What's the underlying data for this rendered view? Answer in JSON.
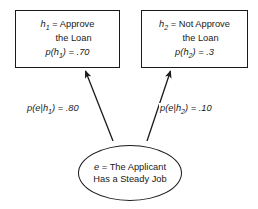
{
  "diagram": {
    "type": "bayesian-inference-tree",
    "nodes": {
      "hypothesis_1": {
        "symbol": "h",
        "subscript": "1",
        "equals": "=",
        "line1": "Approve",
        "line2": "the Loan",
        "prob_prefix": "p(",
        "prob_symbol": "h",
        "prob_subscript": "1",
        "prob_suffix": ") = .70",
        "probability_value": 0.7,
        "full_text": "h1 = Approve the Loan p(h1) = .70"
      },
      "hypothesis_2": {
        "symbol": "h",
        "subscript": "2",
        "equals": "=",
        "line1": "Not Approve",
        "line2": "the Loan",
        "prob_prefix": "p(",
        "prob_symbol": "h",
        "prob_subscript": "2",
        "prob_suffix": ") = .3",
        "probability_value": 0.3,
        "full_text": "h2 = Not Approve the Loan p(h2) = .3"
      },
      "evidence": {
        "symbol": "e",
        "equals": "=",
        "line1": "The Applicant",
        "line2": "Has a Steady Job",
        "full_text": "e = The Applicant Has a Steady Job"
      }
    },
    "edges": [
      {
        "id": "edge-left",
        "from": "evidence",
        "to": "hypothesis_1",
        "label_prefix": "p(",
        "label_symbol_e": "e",
        "label_bar": "|",
        "label_symbol_h": "h",
        "label_subscript": "1",
        "label_suffix": ") = .80",
        "likelihood_value": 0.8,
        "full_text": "p(e|h1) = .80"
      },
      {
        "id": "edge-right",
        "from": "evidence",
        "to": "hypothesis_2",
        "label_prefix": "p(",
        "label_symbol_e": "e",
        "label_bar": "|",
        "label_symbol_h": "h",
        "label_subscript": "2",
        "label_suffix": ") = .10",
        "likelihood_value": 0.1,
        "full_text": "p(e|h2) = .10"
      }
    ],
    "colors": {
      "stroke": "#1a1a1a",
      "background": "#ffffff",
      "text": "#1a1a1a"
    }
  }
}
